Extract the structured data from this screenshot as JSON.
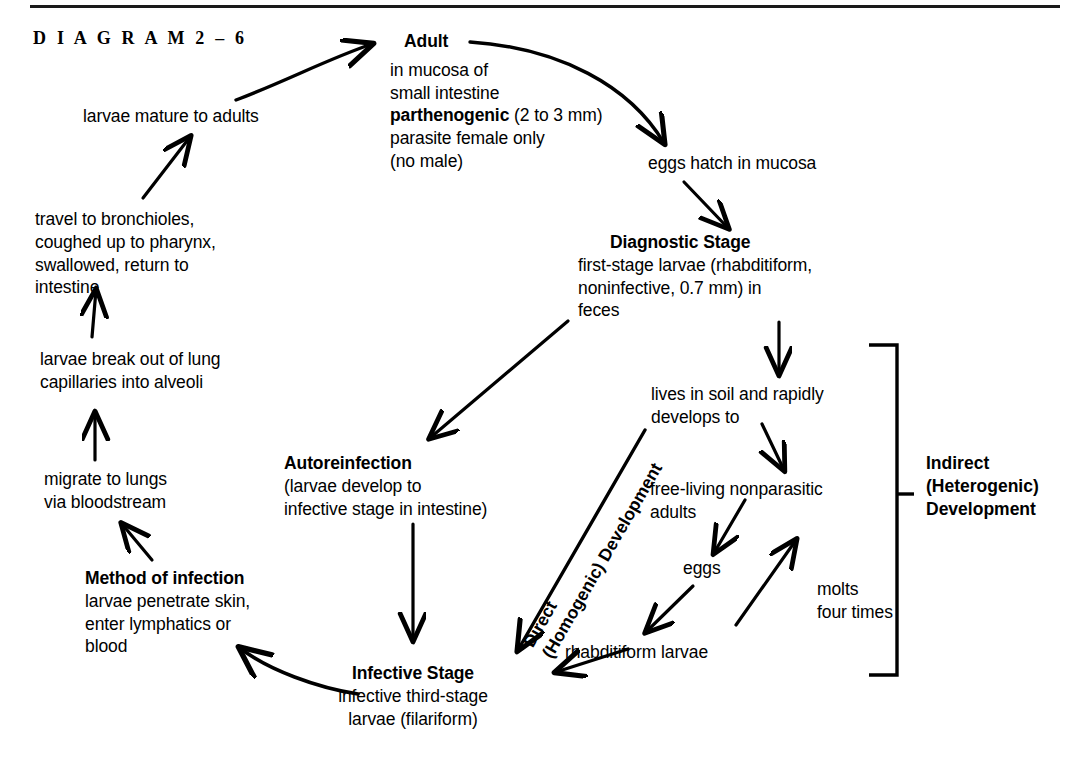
{
  "figure": {
    "caption": "D I A G R A M   2 – 6",
    "top_rule": true,
    "ink_color": "#000000",
    "background": "#ffffff"
  },
  "nodes": {
    "adult": {
      "title": "Adult",
      "lines": [
        "in mucosa of",
        "small intestine",
        "parthenogenic (2 to 3 mm)",
        "parasite female only",
        "(no male)"
      ],
      "bold_fragment": "parthenogenic",
      "rest_fragment": " (2 to 3 mm)"
    },
    "larvae_mature": {
      "text": "larvae mature to adults"
    },
    "travel_bronchioles": {
      "lines": [
        "travel to bronchioles,",
        "coughed up to pharynx,",
        "swallowed, return to",
        "intestine"
      ]
    },
    "larvae_break_out": {
      "lines": [
        "larvae break out of lung",
        "capillaries into alveoli"
      ]
    },
    "migrate_lungs": {
      "lines": [
        "migrate to lungs",
        "via bloodstream"
      ]
    },
    "method_of_infection": {
      "title": "Method of infection",
      "lines": [
        "larvae penetrate skin,",
        "enter lymphatics or",
        "blood"
      ]
    },
    "eggs_hatch": {
      "text": "eggs hatch in mucosa"
    },
    "diagnostic_stage": {
      "title": "Diagnostic Stage",
      "lines": [
        "first-stage larvae (rhabditiform,",
        "noninfective, 0.7 mm) in",
        "feces"
      ]
    },
    "lives_in_soil": {
      "lines": [
        "lives in soil and rapidly",
        "develops to"
      ]
    },
    "free_living": {
      "lines": [
        "free-living nonparasitic",
        "adults"
      ]
    },
    "eggs": {
      "text": "eggs"
    },
    "molts": {
      "lines": [
        "molts",
        "four times"
      ]
    },
    "rhabditiform_larvae": {
      "text": "rhabditiform larvae"
    },
    "autoreinfection": {
      "title": "Autoreinfection",
      "lines": [
        "(larvae develop to",
        "infective stage in intestine)"
      ]
    },
    "infective_stage": {
      "title": "Infective Stage",
      "lines": [
        "infective third-stage",
        "larvae (filariform)"
      ]
    },
    "direct_development": {
      "lines": [
        "Direct",
        "(Homogenic) Development"
      ]
    },
    "indirect_development": {
      "lines": [
        "Indirect",
        "(Heterogenic)",
        "Development"
      ]
    }
  },
  "arrows": [
    {
      "name": "larvae-mature-to-adult",
      "from": "larvae mature to adults",
      "to": "Adult",
      "style": "curved"
    },
    {
      "name": "adult-to-eggs-hatch",
      "from": "Adult",
      "to": "eggs hatch in mucosa",
      "style": "curved"
    },
    {
      "name": "eggs-hatch-to-diagnostic-stage",
      "from": "eggs hatch in mucosa",
      "to": "Diagnostic Stage",
      "style": "straight"
    },
    {
      "name": "diagnostic-stage-to-lives-in-soil",
      "from": "Diagnostic Stage",
      "to": "lives in soil and rapidly develops to",
      "style": "straight"
    },
    {
      "name": "feces-to-autoreinfection",
      "from": "feces",
      "to": "Autoreinfection",
      "style": "straight"
    },
    {
      "name": "lives-in-soil-to-free-living",
      "from": "lives in soil and rapidly develops to",
      "to": "free-living nonparasitic adults",
      "style": "straight"
    },
    {
      "name": "free-living-to-eggs",
      "from": "free-living nonparasitic adults",
      "to": "eggs",
      "style": "straight"
    },
    {
      "name": "eggs-to-rhabditiform-larvae",
      "from": "eggs",
      "to": "rhabditiform larvae",
      "style": "straight"
    },
    {
      "name": "molts-four-times",
      "from": "rhabditiform larvae",
      "to": "free-living nonparasitic adults",
      "style": "straight"
    },
    {
      "name": "rhabditiform-to-infective-stage",
      "from": "rhabditiform larvae",
      "to": "Infective Stage",
      "style": "straight"
    },
    {
      "name": "direct-development-to-infective-stage",
      "from": "lives in soil and rapidly develops to",
      "to": "Infective Stage",
      "style": "straight"
    },
    {
      "name": "autoreinfection-to-infective-stage",
      "from": "Autoreinfection",
      "to": "Infective Stage",
      "style": "straight"
    },
    {
      "name": "infective-stage-to-method-of-infection",
      "from": "Infective Stage",
      "to": "Method of infection",
      "style": "curved"
    },
    {
      "name": "method-of-infection-to-migrate",
      "from": "Method of infection",
      "to": "migrate to lungs via bloodstream",
      "style": "straight"
    },
    {
      "name": "migrate-to-larvae-break-out",
      "from": "migrate to lungs via bloodstream",
      "to": "larvae break out of lung capillaries into alveoli",
      "style": "straight"
    },
    {
      "name": "larvae-break-out-to-travel",
      "from": "larvae break out of lung capillaries into alveoli",
      "to": "travel to bronchioles",
      "style": "straight"
    },
    {
      "name": "travel-to-larvae-mature",
      "from": "travel to bronchioles",
      "to": "larvae mature to adults",
      "style": "straight"
    }
  ]
}
